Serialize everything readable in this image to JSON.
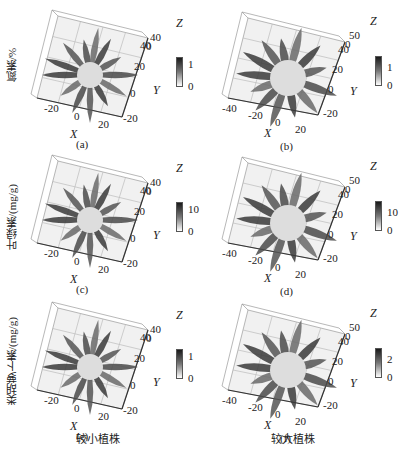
{
  "chart_data": [
    {
      "panel": "a",
      "type": "scatter3d",
      "row_label": "氮素/%",
      "caption": "(a)",
      "xlabel": "X",
      "ylabel": "Y",
      "zlabel": "Z",
      "x_ticks": [
        "-20",
        "0",
        "20"
      ],
      "y_ticks": [
        "-20",
        "0",
        "20",
        "40"
      ],
      "z_ticks": [
        "0",
        "40"
      ],
      "colorbar_ticks": [
        "0",
        "1"
      ],
      "colorbar_range": [
        0,
        1
      ]
    },
    {
      "panel": "b",
      "type": "scatter3d",
      "caption": "(b)",
      "xlabel": "X",
      "ylabel": "Y",
      "zlabel": "Z",
      "x_ticks": [
        "-40",
        "-20",
        "0",
        "20"
      ],
      "y_ticks": [
        "-20",
        "0",
        "20",
        "40"
      ],
      "z_ticks": [
        "0",
        "50"
      ],
      "colorbar_ticks": [
        "0",
        "1"
      ],
      "colorbar_range": [
        0,
        1
      ]
    },
    {
      "panel": "c",
      "type": "scatter3d",
      "row_label": "叶绿素/(mg/g)",
      "caption": "(c)",
      "xlabel": "X",
      "ylabel": "Y",
      "zlabel": "Z",
      "x_ticks": [
        "-20",
        "0",
        "20"
      ],
      "y_ticks": [
        "-20",
        "0",
        "20",
        "40"
      ],
      "z_ticks": [
        "0",
        "40"
      ],
      "colorbar_ticks": [
        "0",
        "10"
      ],
      "colorbar_range": [
        0,
        10
      ]
    },
    {
      "panel": "d",
      "type": "scatter3d",
      "caption": "(d)",
      "xlabel": "X",
      "ylabel": "Y",
      "zlabel": "Z",
      "x_ticks": [
        "-40",
        "-20",
        "0",
        "20"
      ],
      "y_ticks": [
        "-20",
        "0",
        "20",
        "40"
      ],
      "z_ticks": [
        "0",
        "50"
      ],
      "colorbar_ticks": [
        "0",
        "10"
      ],
      "colorbar_range": [
        0,
        10
      ]
    },
    {
      "panel": "e",
      "type": "scatter3d",
      "row_label": "类胡萝卜素/(mg/g)",
      "caption": "(e)",
      "xlabel": "X",
      "ylabel": "Y",
      "zlabel": "Z",
      "x_ticks": [
        "-20",
        "0",
        "20"
      ],
      "y_ticks": [
        "-20",
        "0",
        "20",
        "40"
      ],
      "z_ticks": [
        "0",
        "40"
      ],
      "colorbar_ticks": [
        "0",
        "1"
      ],
      "colorbar_range": [
        0,
        1
      ]
    },
    {
      "panel": "f",
      "type": "scatter3d",
      "caption": "(f)",
      "xlabel": "X",
      "ylabel": "Y",
      "zlabel": "Z",
      "x_ticks": [
        "-40",
        "-20",
        "0",
        "20"
      ],
      "y_ticks": [
        "-20",
        "0",
        "20",
        "40"
      ],
      "z_ticks": [
        "0",
        "50"
      ],
      "colorbar_ticks": [
        "0",
        "2"
      ],
      "colorbar_range": [
        0,
        2
      ]
    }
  ],
  "rows": [
    {
      "label": "氮素/%"
    },
    {
      "label": "叶绿素/(mg/g)"
    },
    {
      "label": "类胡萝卜素/(mg/g)"
    }
  ],
  "columns": [
    {
      "label": "较小植株"
    },
    {
      "label": "较大植株"
    }
  ],
  "panels": {
    "a": {
      "caption": "(a)",
      "x": "X",
      "y": "Y",
      "z": "Z",
      "xt": [
        "-20",
        "0",
        "20"
      ],
      "yt": [
        "-20",
        "0",
        "20",
        "40"
      ],
      "zt": [
        "0",
        "40"
      ],
      "cb": [
        "1",
        "0"
      ]
    },
    "b": {
      "caption": "(b)",
      "x": "X",
      "y": "Y",
      "z": "Z",
      "xt": [
        "-40",
        "-20",
        "0",
        "20"
      ],
      "yt": [
        "-20",
        "0",
        "20",
        "40"
      ],
      "zt": [
        "0",
        "50"
      ],
      "cb": [
        "1",
        "0"
      ]
    },
    "c": {
      "caption": "(c)",
      "x": "X",
      "y": "Y",
      "z": "Z",
      "xt": [
        "-20",
        "0",
        "20"
      ],
      "yt": [
        "-20",
        "0",
        "20",
        "40"
      ],
      "zt": [
        "0",
        "40"
      ],
      "cb": [
        "10",
        "0"
      ]
    },
    "d": {
      "caption": "(d)",
      "x": "X",
      "y": "Y",
      "z": "Z",
      "xt": [
        "-40",
        "-20",
        "0",
        "20"
      ],
      "yt": [
        "-20",
        "0",
        "20",
        "40"
      ],
      "zt": [
        "0",
        "50"
      ],
      "cb": [
        "10",
        "0"
      ]
    },
    "e": {
      "caption": "(e)",
      "x": "X",
      "y": "Y",
      "z": "Z",
      "xt": [
        "-20",
        "0",
        "20"
      ],
      "yt": [
        "-20",
        "0",
        "20",
        "40"
      ],
      "zt": [
        "0",
        "40"
      ],
      "cb": [
        "1",
        "0"
      ]
    },
    "f": {
      "caption": "(f)",
      "x": "X",
      "y": "Y",
      "z": "Z",
      "xt": [
        "-40",
        "-20",
        "0",
        "20"
      ],
      "yt": [
        "-20",
        "0",
        "20",
        "40"
      ],
      "zt": [
        "0",
        "50"
      ],
      "cb": [
        "2",
        "0"
      ]
    }
  }
}
